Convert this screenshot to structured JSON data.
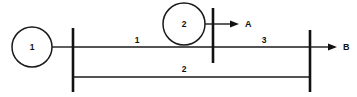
{
  "diagram": {
    "type": "single-line-power-system-diagram",
    "canvas": {
      "width": 357,
      "height": 97
    },
    "background_color": "#ffffff",
    "line_color": "#1a1a1a",
    "machines": [
      {
        "id": "machine-1",
        "label": "1",
        "cx": 32,
        "cy": 47,
        "r": 20
      },
      {
        "id": "machine-2",
        "label": "2",
        "cx": 184,
        "cy": 24,
        "r": 21
      }
    ],
    "buses": [
      {
        "id": "bus-left",
        "x": 73,
        "y1": 28,
        "y2": 92
      },
      {
        "id": "bus-middle",
        "x": 213,
        "y1": 8,
        "y2": 63
      },
      {
        "id": "bus-right",
        "x": 310,
        "y1": 30,
        "y2": 92
      }
    ],
    "branches": [
      {
        "id": "branch-1",
        "label": "1",
        "x1": 73,
        "x2": 213,
        "y": 47,
        "label_x": 137,
        "label_y": 41
      },
      {
        "id": "branch-3",
        "label": "3",
        "x1": 213,
        "x2": 310,
        "y": 47,
        "label_x": 264,
        "label_y": 41
      },
      {
        "id": "branch-2",
        "label": "2",
        "x1": 73,
        "x2": 310,
        "y": 77,
        "label_x": 184,
        "label_y": 70
      }
    ],
    "connectors": [
      {
        "id": "machine-1-lead",
        "x1": 52,
        "x2": 73,
        "y": 47
      },
      {
        "id": "machine-2-lead",
        "x1": 205,
        "x2": 213,
        "y": 24
      },
      {
        "id": "bus-left-lower-stub",
        "x1": 73,
        "x2": 82,
        "y": 77
      },
      {
        "id": "bus-right-lower-stub",
        "x1": 301,
        "x2": 310,
        "y": 77
      }
    ],
    "loads": [
      {
        "id": "load-a",
        "label": "A",
        "x1": 213,
        "x2": 231,
        "y": 24,
        "tip_x": 239,
        "label_x": 245,
        "label_y": 24
      },
      {
        "id": "load-b",
        "label": "B",
        "x1": 310,
        "x2": 329,
        "y": 47,
        "tip_x": 337,
        "label_x": 343,
        "label_y": 47
      }
    ]
  }
}
